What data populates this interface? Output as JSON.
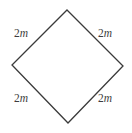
{
  "figure": {
    "type": "geometry-diagram",
    "shape_name": "square-rhombus",
    "background_color": "#ffffff",
    "stroke_color": "#3a3a3a",
    "stroke_width": 1.3,
    "vertices": {
      "top": {
        "x": 67,
        "y": 10
      },
      "right": {
        "x": 123,
        "y": 66
      },
      "bottom": {
        "x": 68,
        "y": 123
      },
      "left": {
        "x": 12,
        "y": 65
      }
    },
    "labels": {
      "top_left": {
        "number": "2",
        "variable": "m"
      },
      "top_right": {
        "number": "2",
        "variable": "m"
      },
      "bottom_left": {
        "number": "2",
        "variable": "m"
      },
      "bottom_right": {
        "number": "2",
        "variable": "m"
      }
    }
  }
}
